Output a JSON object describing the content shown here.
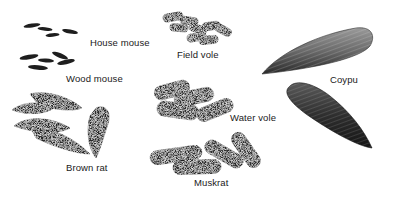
{
  "illustration": {
    "subject": "Rodent droppings comparison",
    "specimens": [
      {
        "id": "house-mouse",
        "label": "House mouse"
      },
      {
        "id": "wood-mouse",
        "label": "Wood mouse"
      },
      {
        "id": "field-vole",
        "label": "Field vole"
      },
      {
        "id": "coypu",
        "label": "Coypu"
      },
      {
        "id": "water-vole",
        "label": "Water vole"
      },
      {
        "id": "brown-rat",
        "label": "Brown rat"
      },
      {
        "id": "muskrat",
        "label": "Muskrat"
      }
    ]
  },
  "colors": {
    "background": "#ffffff",
    "dropping_dark": "#1e1e1e",
    "dropping_mid": "#3a3a3a",
    "dropping_light": "#6a6a6a",
    "label_text": "#1a1a1a"
  }
}
